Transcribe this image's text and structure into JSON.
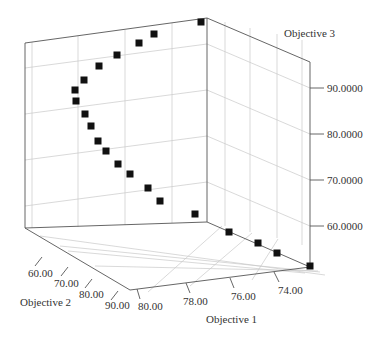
{
  "chart_data": {
    "type": "scatter3d",
    "title": "",
    "axes": {
      "x": {
        "label": "Objective 1",
        "ticks": [
          "80.00",
          "78.00",
          "76.00",
          "74.00"
        ],
        "range": [
          80,
          73
        ]
      },
      "y": {
        "label": "Objective 2",
        "ticks": [
          "60.00",
          "70.00",
          "80.00",
          "90.00"
        ],
        "range": [
          55,
          92
        ]
      },
      "z": {
        "label": "Objective 3",
        "ticks": [
          "60.0000",
          "70.0000",
          "80.0000",
          "90.0000"
        ],
        "range": [
          52,
          100
        ]
      }
    },
    "grid": true,
    "legend": null,
    "marker": {
      "shape": "square",
      "color": "#111111"
    },
    "series": [
      {
        "name": "Pareto front",
        "points_px": [
          [
            201,
            22
          ],
          [
            154,
            34
          ],
          [
            139,
            43
          ],
          [
            117,
            55
          ],
          [
            99,
            66
          ],
          [
            84,
            80
          ],
          [
            75,
            90
          ],
          [
            76,
            101
          ],
          [
            85,
            114
          ],
          [
            91,
            126
          ],
          [
            98,
            141
          ],
          [
            106,
            151
          ],
          [
            118,
            164
          ],
          [
            130,
            174
          ],
          [
            148,
            188
          ],
          [
            160,
            201
          ],
          [
            195,
            214
          ],
          [
            229,
            232
          ],
          [
            258,
            243
          ],
          [
            277,
            253
          ],
          [
            310,
            266
          ]
        ]
      }
    ]
  },
  "labels": {
    "z_axis": "Objective 3",
    "y_axis": "Objective 2",
    "x_axis": "Objective 1",
    "z_ticks": [
      "90.0000",
      "80.0000",
      "70.0000",
      "60.0000"
    ],
    "y_ticks": [
      "60.00",
      "70.00",
      "80.00",
      "90.00"
    ],
    "x_ticks": [
      "80.00",
      "78.00",
      "76.00",
      "74.00"
    ]
  }
}
